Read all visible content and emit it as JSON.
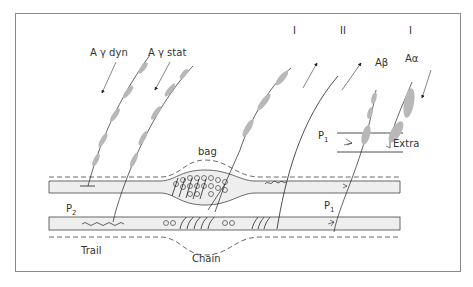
{
  "diagram": {
    "labels": {
      "gamma_dyn": "A γ dyn",
      "gamma_stat": "A γ stat",
      "group_I_left": "I",
      "group_II": "II",
      "group_I_right": "I",
      "a_beta": "Aβ",
      "a_alpha": "Aα",
      "bag": "bag",
      "chain": "Chain",
      "trail": "Trail",
      "p2": "P",
      "p2_sub": "2",
      "p1_top": "P",
      "p1_top_sub": "1",
      "p1_mid": "P",
      "p1_mid_sub": "1",
      "extra": "Extra"
    },
    "colors": {
      "line": "#222222",
      "myelin": "#b8b8b8",
      "fiber_fill": "#eeeeee",
      "frame": "#8a8a8a"
    }
  }
}
